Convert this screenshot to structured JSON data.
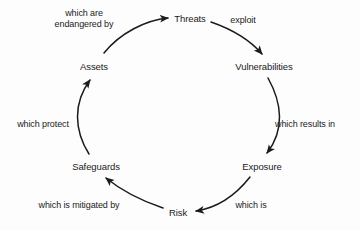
{
  "diagram": {
    "type": "cycle-diagram",
    "background_color": "#fdfdfd",
    "stroke_color": "#1b1b1b",
    "text_color": "#1b1b1b",
    "nodes": [
      {
        "id": "threats",
        "label": "Threats",
        "x": 190,
        "y": 18
      },
      {
        "id": "vulnerabilities",
        "label": "Vulnerabilities",
        "x": 264,
        "y": 66
      },
      {
        "id": "exposure",
        "label": "Exposure",
        "x": 262,
        "y": 166
      },
      {
        "id": "risk",
        "label": "Risk",
        "x": 178,
        "y": 212
      },
      {
        "id": "safeguards",
        "label": "Safeguards",
        "x": 96,
        "y": 166
      },
      {
        "id": "assets",
        "label": "Assets",
        "x": 94,
        "y": 66
      }
    ],
    "edges": [
      {
        "id": "threats-exploit-vulnerabilities",
        "from": "threats",
        "to": "vulnerabilities",
        "label": "exploit",
        "label_x": 243,
        "label_y": 20
      },
      {
        "id": "vulnerabilities-results-exposure",
        "from": "vulnerabilities",
        "to": "exposure",
        "label": "which results in",
        "label_x": 305,
        "label_y": 124
      },
      {
        "id": "exposure-which-is-risk",
        "from": "exposure",
        "to": "risk",
        "label": "which is",
        "label_x": 251,
        "label_y": 205
      },
      {
        "id": "risk-mitigated-safeguards",
        "from": "risk",
        "to": "safeguards",
        "label": "which is mitigated by",
        "label_x": 79,
        "label_y": 205
      },
      {
        "id": "safeguards-protect-assets",
        "from": "safeguards",
        "to": "assets",
        "label": "which protect",
        "label_x": 43,
        "label_y": 124
      },
      {
        "id": "assets-endangered-threats",
        "from": "assets",
        "to": "threats",
        "label": "which are\nendangered by",
        "label_x": 84,
        "label_y": 19
      }
    ]
  }
}
